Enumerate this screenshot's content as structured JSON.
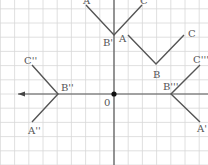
{
  "diagram": {
    "origin_label": "0",
    "grid_color": "#d8d8d8",
    "axis_color": "#555555",
    "line_color": "#555555",
    "figures": [
      {
        "name": "figure-top",
        "points": [
          [
            86,
            5
          ],
          [
            114,
            35
          ],
          [
            142,
            5
          ]
        ],
        "labels": [
          {
            "text": "A",
            "x": 83,
            "y": 4
          },
          {
            "text": "B'",
            "x": 103,
            "y": 46
          },
          {
            "text": "C",
            "x": 140,
            "y": 4
          }
        ]
      },
      {
        "name": "figure-original",
        "points": [
          [
            128,
            35
          ],
          [
            156,
            64
          ],
          [
            184,
            35
          ]
        ],
        "labels": [
          {
            "text": "A",
            "x": 119,
            "y": 42
          },
          {
            "text": "B",
            "x": 153,
            "y": 78
          },
          {
            "text": "C",
            "x": 188,
            "y": 37
          }
        ]
      },
      {
        "name": "figure-left",
        "points": [
          [
            32,
            65
          ],
          [
            58,
            94
          ],
          [
            32,
            122
          ]
        ],
        "labels": [
          {
            "text": "C''",
            "x": 24,
            "y": 64
          },
          {
            "text": "B''",
            "x": 61,
            "y": 91
          },
          {
            "text": "A''",
            "x": 28,
            "y": 134
          }
        ]
      },
      {
        "name": "figure-right",
        "points": [
          [
            200,
            65
          ],
          [
            171,
            94
          ],
          [
            200,
            122
          ]
        ],
        "labels": [
          {
            "text": "C'''",
            "x": 193,
            "y": 63
          },
          {
            "text": "B'''",
            "x": 163,
            "y": 90
          },
          {
            "text": "A'",
            "x": 197,
            "y": 132
          }
        ]
      }
    ]
  }
}
